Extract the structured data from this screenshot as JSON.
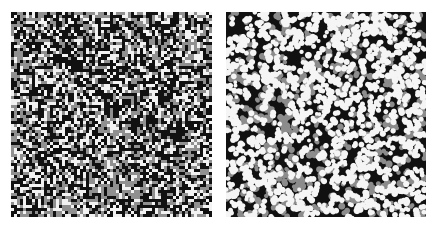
{
  "figure": {
    "title": "",
    "caption": "",
    "background_color": "#ffffff",
    "panel_count": 2,
    "layout": "side-by-side"
  },
  "chart_data": {
    "type": "heatmap",
    "title": "",
    "subtitle": "",
    "xlabel": "",
    "ylabel": "",
    "grid": false,
    "legend_position": "none",
    "annotations": [],
    "tick_labels": {
      "x": [],
      "y": []
    },
    "shared_palette": {
      "background": "#111111",
      "low": "#111111",
      "mid": "#909090",
      "high": "#f2f2f2",
      "levels": 3,
      "level_labels": [
        "black",
        "gray",
        "white"
      ]
    },
    "panels": [
      {
        "name": "left-panel",
        "label": "",
        "type": "heatmap",
        "description": "Grid-aligned three-level random field, coarse blocky cells",
        "cell_size_px": 3,
        "grid_cols": 67,
        "grid_rows": 68,
        "xlim": [
          0,
          67
        ],
        "ylim": [
          0,
          68
        ],
        "value_levels": [
          0,
          1,
          2
        ],
        "level_colors": [
          "#111111",
          "#909090",
          "#f2f2f2"
        ],
        "level_fractions": [
          0.46,
          0.27,
          0.27
        ],
        "smoothing": 0,
        "seed": 20394,
        "blob_radius_px": 0,
        "rect_px": {
          "x": 11,
          "y": 12,
          "w": 201,
          "h": 205
        }
      },
      {
        "name": "right-panel",
        "label": "",
        "type": "heatmap",
        "description": "Smoothed three-level random field, rounded blob clusters on dark ground",
        "cell_size_px": 2,
        "grid_cols": 100,
        "grid_rows": 103,
        "xlim": [
          0,
          100
        ],
        "ylim": [
          0,
          103
        ],
        "value_levels": [
          0,
          1,
          2
        ],
        "level_colors": [
          "#111111",
          "#8c8c8c",
          "#f5f5f5"
        ],
        "level_fractions": [
          0.62,
          0.12,
          0.26
        ],
        "smoothing": 1,
        "seed": 77311,
        "blob_radius_px": 2.6,
        "rect_px": {
          "x": 226,
          "y": 12,
          "w": 200,
          "h": 205
        }
      }
    ]
  }
}
